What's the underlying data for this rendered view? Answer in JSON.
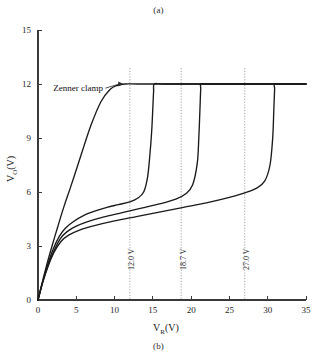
{
  "figure": {
    "caption_top": "(a)",
    "caption_bottom": "(b)"
  },
  "chart_data": {
    "type": "line",
    "title": "",
    "xlabel": "V_R (V)",
    "xlabel_base": "V",
    "xlabel_sub": "R",
    "xlabel_unit": "(V)",
    "ylabel": "V_O (V)",
    "ylabel_base": "V",
    "ylabel_sub": "O",
    "ylabel_unit": "(V)",
    "xlim": [
      0,
      35
    ],
    "ylim": [
      0,
      15
    ],
    "xticks": [
      0,
      5,
      10,
      15,
      20,
      25,
      30,
      35
    ],
    "yticks": [
      0,
      3,
      6,
      9,
      12,
      15
    ],
    "xtick_labels": [
      "0",
      "5",
      "10",
      "15",
      "20",
      "25",
      "30",
      "35"
    ],
    "ytick_labels": [
      "0",
      "3",
      "6",
      "9",
      "12",
      "15"
    ],
    "grid": false,
    "legend_position": "none",
    "clamp_level": 12,
    "annotations": [
      {
        "name": "zenner-clamp",
        "text": "Zenner clamp",
        "x": 2.0,
        "y": 11.6,
        "points_to_x": 11.0,
        "points_to_y": 12.0
      }
    ],
    "vlines": [
      {
        "x": 12.0,
        "label": "12.0 V"
      },
      {
        "x": 18.7,
        "label": "18.7 V"
      },
      {
        "x": 27.0,
        "label": "27.0 V"
      }
    ],
    "series": [
      {
        "name": "curve-1",
        "breakdown_v": 12.0,
        "points": [
          [
            0.0,
            0.0
          ],
          [
            0.6,
            1.05
          ],
          [
            1.2,
            2.05
          ],
          [
            1.9,
            3.1
          ],
          [
            2.6,
            4.1
          ],
          [
            3.4,
            5.2
          ],
          [
            4.2,
            6.2
          ],
          [
            5.2,
            7.5
          ],
          [
            6.0,
            8.55
          ],
          [
            7.0,
            9.8
          ],
          [
            8.2,
            11.0
          ],
          [
            9.4,
            11.7
          ],
          [
            10.4,
            11.93
          ],
          [
            11.4,
            12.0
          ],
          [
            13.0,
            12.0
          ],
          [
            18.0,
            12.0
          ],
          [
            24.0,
            12.0
          ],
          [
            30.0,
            12.0
          ],
          [
            35.0,
            12.0
          ]
        ]
      },
      {
        "name": "curve-2",
        "breakdown_v": 15.1,
        "points": [
          [
            0.0,
            0.0
          ],
          [
            0.6,
            1.0
          ],
          [
            1.3,
            2.0
          ],
          [
            2.0,
            2.85
          ],
          [
            2.8,
            3.55
          ],
          [
            3.6,
            4.0
          ],
          [
            4.6,
            4.35
          ],
          [
            6.0,
            4.7
          ],
          [
            7.5,
            4.95
          ],
          [
            9.0,
            5.15
          ],
          [
            10.5,
            5.3
          ],
          [
            12.0,
            5.45
          ],
          [
            13.0,
            5.65
          ],
          [
            13.8,
            6.0
          ],
          [
            14.3,
            6.8
          ],
          [
            14.6,
            8.0
          ],
          [
            14.85,
            9.4
          ],
          [
            15.0,
            10.7
          ],
          [
            15.1,
            11.6
          ],
          [
            15.2,
            12.0
          ],
          [
            16.5,
            12.0
          ],
          [
            22.0,
            12.0
          ],
          [
            28.0,
            12.0
          ],
          [
            35.0,
            12.0
          ]
        ]
      },
      {
        "name": "curve-3",
        "breakdown_v": 21.2,
        "points": [
          [
            0.0,
            0.0
          ],
          [
            0.6,
            0.98
          ],
          [
            1.3,
            1.92
          ],
          [
            2.1,
            2.75
          ],
          [
            2.9,
            3.4
          ],
          [
            3.8,
            3.8
          ],
          [
            5.0,
            4.1
          ],
          [
            6.5,
            4.35
          ],
          [
            8.5,
            4.6
          ],
          [
            11.0,
            4.85
          ],
          [
            13.5,
            5.1
          ],
          [
            16.0,
            5.35
          ],
          [
            18.0,
            5.6
          ],
          [
            19.3,
            5.9
          ],
          [
            20.2,
            6.4
          ],
          [
            20.8,
            7.6
          ],
          [
            21.0,
            9.0
          ],
          [
            21.15,
            10.6
          ],
          [
            21.25,
            11.7
          ],
          [
            21.35,
            12.0
          ],
          [
            23.0,
            12.0
          ],
          [
            28.0,
            12.0
          ],
          [
            35.0,
            12.0
          ]
        ]
      },
      {
        "name": "curve-4",
        "breakdown_v": 30.8,
        "points": [
          [
            0.0,
            0.0
          ],
          [
            0.6,
            0.95
          ],
          [
            1.3,
            1.85
          ],
          [
            2.1,
            2.65
          ],
          [
            3.0,
            3.25
          ],
          [
            4.0,
            3.6
          ],
          [
            5.5,
            3.9
          ],
          [
            7.5,
            4.15
          ],
          [
            10.0,
            4.4
          ],
          [
            13.0,
            4.65
          ],
          [
            16.0,
            4.9
          ],
          [
            19.0,
            5.15
          ],
          [
            22.0,
            5.4
          ],
          [
            25.0,
            5.7
          ],
          [
            27.0,
            5.95
          ],
          [
            28.5,
            6.2
          ],
          [
            29.6,
            6.6
          ],
          [
            30.3,
            7.5
          ],
          [
            30.65,
            9.0
          ],
          [
            30.8,
            10.6
          ],
          [
            30.9,
            11.7
          ],
          [
            30.95,
            12.0
          ],
          [
            32.5,
            12.0
          ],
          [
            35.0,
            12.0
          ]
        ]
      }
    ]
  }
}
